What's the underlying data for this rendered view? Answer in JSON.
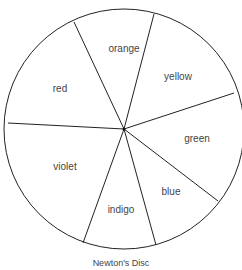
{
  "title": "Newton's Disc",
  "segments": [
    {
      "label": "red",
      "lx": 58,
      "ly": 92
    },
    {
      "label": "orange",
      "lx": 114,
      "ly": 51
    },
    {
      "label": "yellow",
      "lx": 174,
      "ly": 80
    },
    {
      "label": "green",
      "lx": 194,
      "ly": 142
    },
    {
      "label": "blue",
      "lx": 171,
      "ly": 194
    },
    {
      "label": "indigo",
      "lx": 121,
      "ly": 213
    },
    {
      "label": "violet",
      "lx": 64,
      "ly": 170
    }
  ],
  "colors": {
    "stroke": "#222222",
    "text": "#444444",
    "background": "#ffffff"
  }
}
